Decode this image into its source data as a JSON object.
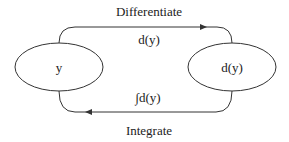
{
  "diagram": {
    "nodes": [
      {
        "id": "y",
        "label": "y"
      },
      {
        "id": "dy",
        "label": "d(y)"
      }
    ],
    "edges": [
      {
        "from": "y",
        "to": "dy",
        "label": "Differentiate",
        "sublabel": "d(y)"
      },
      {
        "from": "dy",
        "to": "y",
        "label": "Integrate",
        "sublabel": "∫d(y)"
      }
    ],
    "colors": {
      "stroke": "#333333",
      "text": "#222222",
      "background": "#ffffff"
    }
  }
}
